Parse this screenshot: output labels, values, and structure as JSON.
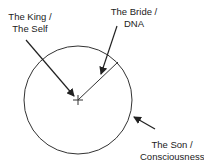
{
  "diagram": {
    "labels": {
      "king": {
        "line1": "The King /",
        "line2": "The Self"
      },
      "bride": {
        "line1": "The Bride /",
        "line2": "DNA"
      },
      "son": {
        "line1": "The Son /",
        "line2": "Consciousness"
      }
    },
    "colors": {
      "stroke": "#333333",
      "text": "#222222",
      "background": "#ffffff"
    }
  }
}
